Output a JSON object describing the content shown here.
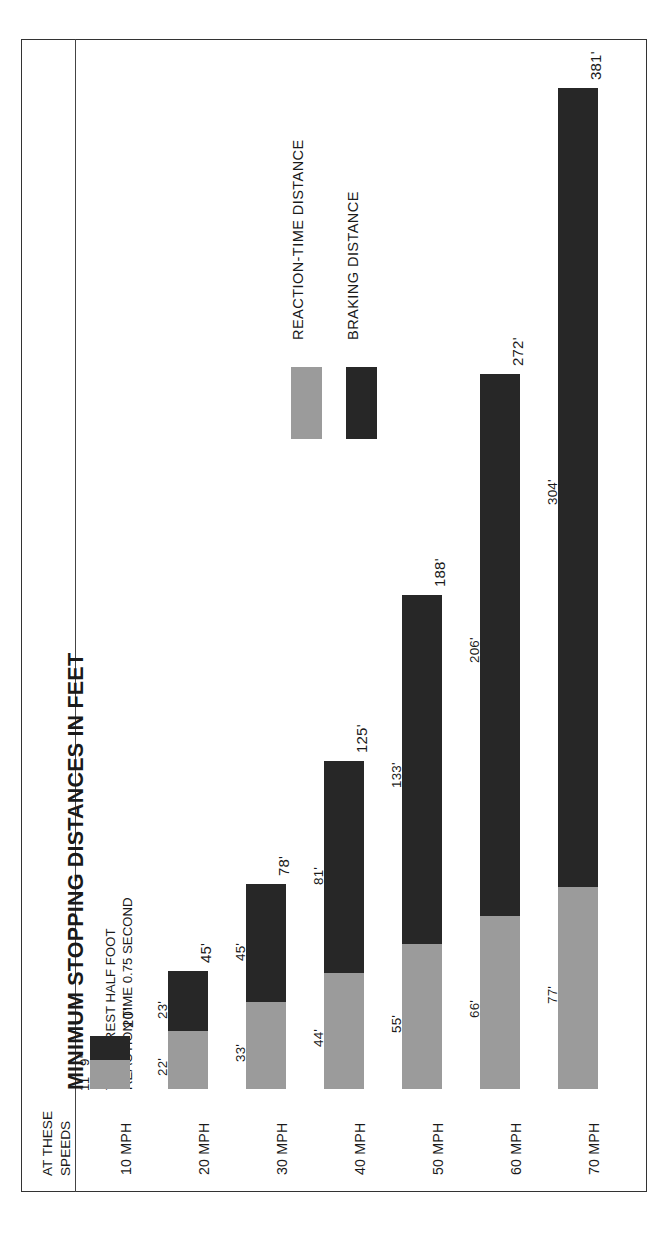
{
  "title": "MINIMUM STOPPING DISTANCES IN FEET",
  "subtitle_line1": "TO NEAREST HALF FOOT",
  "subtitle_line2": "REACTION TIME 0.75 SECOND",
  "axis_caption_line1": "AT THESE",
  "axis_caption_line2": "SPEEDS",
  "legend": {
    "reaction_label": "REACTION-TIME DISTANCE",
    "braking_label": "BRAKING DISTANCE",
    "reaction_color": "#9b9b9b",
    "braking_color": "#272727"
  },
  "rows": [
    {
      "speed": "10 MPH",
      "reaction": "11'",
      "braking": "9'",
      "total": "20'"
    },
    {
      "speed": "20 MPH",
      "reaction": "22'",
      "braking": "23'",
      "total": "45'"
    },
    {
      "speed": "30 MPH",
      "reaction": "33'",
      "braking": "45'",
      "total": "78'"
    },
    {
      "speed": "40 MPH",
      "reaction": "44'",
      "braking": "81'",
      "total": "125'"
    },
    {
      "speed": "50 MPH",
      "reaction": "55'",
      "braking": "133'",
      "total": "188'"
    },
    {
      "speed": "60 MPH",
      "reaction": "66'",
      "braking": "206'",
      "total": "272'"
    },
    {
      "speed": "70 MPH",
      "reaction": "77'",
      "braking": "304'",
      "total": "381'"
    }
  ],
  "chart_data": {
    "type": "bar",
    "orientation": "horizontal-stacked",
    "title": "MINIMUM STOPPING DISTANCES IN FEET",
    "subtitle": "TO NEAREST HALF FOOT / REACTION TIME 0.75 SECOND",
    "xlabel": "AT THESE SPEEDS",
    "ylabel": "",
    "categories": [
      "10 MPH",
      "20 MPH",
      "30 MPH",
      "40 MPH",
      "50 MPH",
      "60 MPH",
      "70 MPH"
    ],
    "series": [
      {
        "name": "REACTION-TIME DISTANCE",
        "color": "#9b9b9b",
        "values": [
          11,
          22,
          33,
          44,
          55,
          66,
          77
        ]
      },
      {
        "name": "BRAKING DISTANCE",
        "color": "#272727",
        "values": [
          9,
          23,
          45,
          81,
          133,
          206,
          304
        ]
      }
    ],
    "totals": [
      20,
      45,
      78,
      125,
      188,
      272,
      381
    ],
    "unit": "feet",
    "axis_range": [
      0,
      381
    ],
    "grid": false,
    "legend_position": "upper-center",
    "stacked": true
  }
}
